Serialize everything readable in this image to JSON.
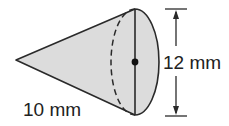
{
  "figure": {
    "shape": "cone",
    "labels": {
      "slant_height": "10 mm",
      "diameter": "12 mm"
    },
    "colors": {
      "fill": "#dcdcdc",
      "stroke": "#2a2a2a",
      "background": "#ffffff"
    }
  }
}
